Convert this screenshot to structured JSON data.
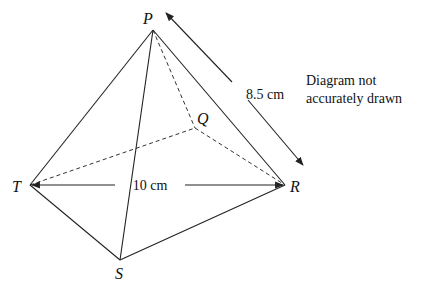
{
  "diagram": {
    "type": "pyramid",
    "vertices": {
      "P": {
        "label": "P",
        "x": 153,
        "y": 30
      },
      "Q": {
        "label": "Q",
        "x": 195,
        "y": 128
      },
      "R": {
        "label": "R",
        "x": 285,
        "y": 185
      },
      "S": {
        "label": "S",
        "x": 120,
        "y": 260
      },
      "T": {
        "label": "T",
        "x": 30,
        "y": 185
      }
    },
    "solid_edges": [
      "PT",
      "PS",
      "PR",
      "TS",
      "SR"
    ],
    "hidden_edges": [
      "PQ",
      "TQ",
      "QR"
    ],
    "dimensions": {
      "pr": {
        "label": "8.5 cm"
      },
      "tr": {
        "label": "10 cm"
      }
    },
    "note": {
      "line1": "Diagram not",
      "line2": "accurately drawn"
    },
    "colors": {
      "line": "#222222",
      "background": "#ffffff"
    }
  }
}
